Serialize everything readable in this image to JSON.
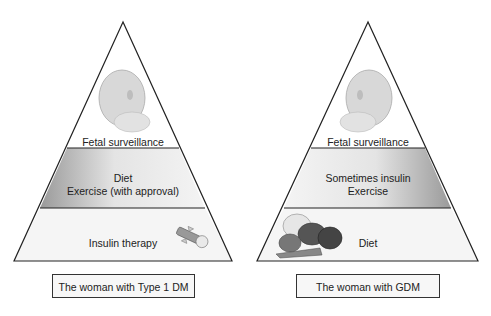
{
  "pyramids": [
    {
      "caption": "The woman with Type 1 DM",
      "tiers": [
        {
          "level": "top",
          "lines": [
            "Fetal surveillance"
          ],
          "image": "fetal-head"
        },
        {
          "level": "middle",
          "lines": [
            "Diet",
            "Exercise (with approval)"
          ]
        },
        {
          "level": "bottom",
          "lines": [
            "Insulin therapy"
          ],
          "image": "insulin-pen"
        }
      ]
    },
    {
      "caption": "The woman with  GDM",
      "tiers": [
        {
          "level": "top",
          "lines": [
            "Fetal surveillance"
          ],
          "image": "fetal-head"
        },
        {
          "level": "middle",
          "lines": [
            "Sometimes insulin",
            "Exercise"
          ]
        },
        {
          "level": "bottom",
          "lines": [
            "Diet"
          ],
          "image": "vegetables"
        }
      ]
    }
  ]
}
